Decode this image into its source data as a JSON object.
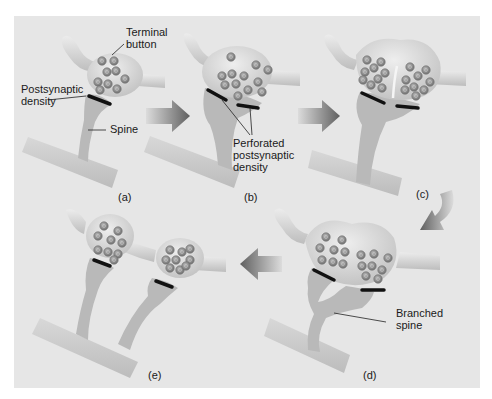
{
  "figure": {
    "background": "#e6e6e6",
    "colors": {
      "membrane": "#cfcfcf",
      "membrane_light": "#e2e2e2",
      "spine": "#b4b4b4",
      "vesicle": "#8c8c8c",
      "density": "#111111",
      "arrow": "#6e6e6e"
    },
    "panels": [
      {
        "id": "a",
        "caption": "(a)"
      },
      {
        "id": "b",
        "caption": "(b)"
      },
      {
        "id": "c",
        "caption": "(c)"
      },
      {
        "id": "d",
        "caption": "(d)"
      },
      {
        "id": "e",
        "caption": "(e)"
      }
    ],
    "labels": {
      "terminal_button_1": "Terminal",
      "terminal_button_2": "button",
      "postsynaptic_density_1": "Postsynaptic",
      "postsynaptic_density_2": "density",
      "spine": "Spine",
      "perforated_1": "Perforated",
      "perforated_2": "postsynaptic",
      "perforated_3": "density",
      "branched_1": "Branched",
      "branched_2": "spine"
    },
    "arrows": [
      {
        "from": "a",
        "to": "b",
        "direction": "right"
      },
      {
        "from": "b",
        "to": "c",
        "direction": "right"
      },
      {
        "from": "c",
        "to": "d",
        "direction": "down-left-curved"
      },
      {
        "from": "d",
        "to": "e",
        "direction": "left"
      }
    ]
  }
}
